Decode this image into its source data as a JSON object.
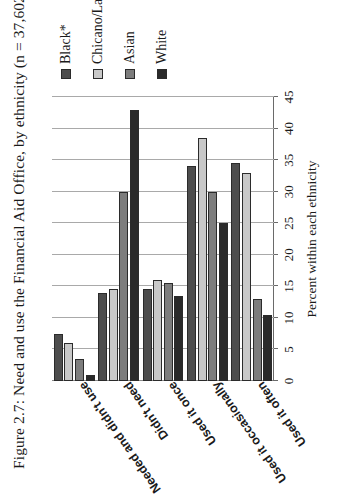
{
  "figure": {
    "title": "Figure 2.7: Need and use the Financial Aid Office, by ethnicity (n = 37,602)"
  },
  "legend": {
    "position": "right",
    "items": [
      {
        "label": "Black*",
        "color": "#4d4d4d"
      },
      {
        "label": "Chicano/Latino",
        "color": "#c8c8c8"
      },
      {
        "label": "Asian",
        "color": "#7d7d7d"
      },
      {
        "label": "White",
        "color": "#2a2a2a"
      }
    ]
  },
  "chart_data": {
    "type": "bar",
    "orientation": "horizontal",
    "title": "Figure 2.7: Need and use the Financial Aid Office, by ethnicity (n = 37,602)",
    "xlabel": "",
    "ylabel": "Percent within each ethnicity",
    "categories": [
      "Needed and didn't use",
      "Didn't need",
      "Used it once",
      "Used it occasionally",
      "Used it often"
    ],
    "series": [
      {
        "name": "Black*",
        "color": "#4d4d4d",
        "values": [
          7.5,
          14.0,
          14.5,
          34.0,
          34.5
        ]
      },
      {
        "name": "Chicano/Latino",
        "color": "#c8c8c8",
        "values": [
          6.0,
          14.5,
          16.0,
          38.5,
          33.0
        ]
      },
      {
        "name": "Asian",
        "color": "#7d7d7d",
        "values": [
          3.5,
          30.0,
          15.5,
          30.0,
          13.0
        ]
      },
      {
        "name": "White",
        "color": "#2a2a2a",
        "values": [
          1.0,
          43.0,
          13.5,
          25.0,
          10.5
        ]
      }
    ],
    "ylim": [
      0,
      45
    ],
    "ticks": [
      0,
      5,
      10,
      15,
      20,
      25,
      30,
      35,
      40,
      45
    ],
    "tick_labels": [
      "0",
      "5",
      "10",
      "15",
      "20",
      "25",
      "30",
      "35",
      "40",
      "45"
    ],
    "grid": true,
    "legend_position": "right"
  }
}
